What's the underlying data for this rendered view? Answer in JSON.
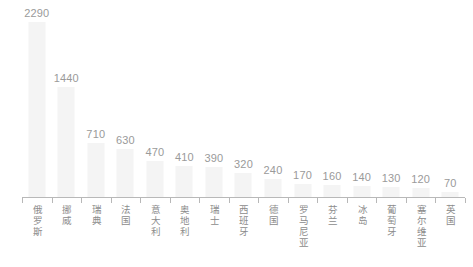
{
  "chart_data": {
    "type": "bar",
    "title": "",
    "subtitle": "",
    "xlabel": "",
    "ylabel": "",
    "ylim": [
      0,
      2290
    ],
    "grid": false,
    "legend": null,
    "categories": [
      "俄罗斯",
      "挪威",
      "瑞典",
      "法国",
      "意大利",
      "奥地利",
      "瑞士",
      "西班牙",
      "德国",
      "罗马尼亚",
      "芬兰",
      "冰岛",
      "葡萄牙",
      "塞尔维亚",
      "英国"
    ],
    "values": [
      2290,
      1440,
      710,
      630,
      470,
      410,
      390,
      320,
      240,
      170,
      160,
      140,
      130,
      120,
      70
    ],
    "data_labels": [
      "2290",
      "1440",
      "710",
      "630",
      "470",
      "410",
      "390",
      "320",
      "240",
      "170",
      "160",
      "140",
      "130",
      "120",
      "70"
    ],
    "bar_color": "#f4f4f4",
    "label_color": "#9a9a9a",
    "axis_color": "#b8b8b8",
    "category_label_color": "#8c8c8c"
  }
}
